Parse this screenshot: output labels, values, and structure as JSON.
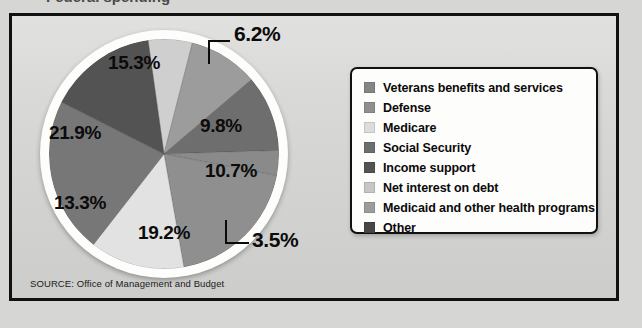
{
  "page": {
    "background_color": "#d6d6d4",
    "partial_title_above_frame": "Federal spending"
  },
  "frame": {
    "border_color": "#111111",
    "background_color": "#d4d4d2"
  },
  "source": {
    "text": "SOURCE: Office of Management and Budget"
  },
  "legend": {
    "items": [
      {
        "label": "Veterans benefits and services",
        "color": "#858585"
      },
      {
        "label": "Defense",
        "color": "#8f8f8f"
      },
      {
        "label": "Medicare",
        "color": "#dcdcdc"
      },
      {
        "label": "Social Security",
        "color": "#6e6e6e"
      },
      {
        "label": "Income support",
        "color": "#535353"
      },
      {
        "label": "Net interest on debt",
        "color": "#c6c6c6"
      },
      {
        "label": "Medicaid and other health programs",
        "color": "#9c9c9c"
      },
      {
        "label": "Other",
        "color": "#474747"
      }
    ]
  },
  "chart_data": {
    "type": "pie",
    "title": "Federal spending",
    "xlabel": "",
    "ylabel": "",
    "units": "percent",
    "legend_position": "right",
    "grid": false,
    "start_angle_deg": -8,
    "direction": "clockwise",
    "categories": [
      "Medicare",
      "Medicaid and other health programs",
      "Social Security",
      "Veterans benefits and services",
      "Defense",
      "Net interest on debt",
      "Income support",
      "Other"
    ],
    "values": [
      6.2,
      9.8,
      10.7,
      3.5,
      19.2,
      13.3,
      21.9,
      15.3
    ],
    "labels": [
      "6.2%",
      "9.8%",
      "10.7%",
      "3.5%",
      "19.2%",
      "13.3%",
      "21.9%",
      "15.3%"
    ],
    "colors": [
      "#cfcfcf",
      "#9c9c9c",
      "#6e6e6e",
      "#8a8a8a",
      "#8f8f8f",
      "#e2e2e2",
      "#777777",
      "#535353"
    ],
    "callout_labels": [
      "6.2%",
      "3.5%"
    ],
    "inner_labels": [
      "9.8%",
      "10.7%",
      "19.2%",
      "13.3%",
      "21.9%",
      "15.3%"
    ]
  }
}
